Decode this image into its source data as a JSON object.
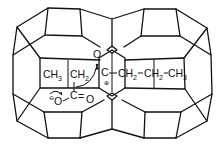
{
  "diagram": {
    "type": "zeolite-cage-transition-state",
    "colors": {
      "line": "#111111",
      "background": "#ffffff"
    },
    "labels": {
      "left_chain": {
        "ch3": "CH",
        "ch3_sub": "3",
        "ch2": "CH",
        "ch2_sub": "2"
      },
      "center_carbon": "C",
      "center_charge": "⊕",
      "right_chain": [
        {
          "text": "CH",
          "sub": "2"
        },
        {
          "text": "CH",
          "sub": "2"
        },
        {
          "text": "CH",
          "sub": "3"
        }
      ],
      "bond": "–",
      "carboxylate": {
        "o_minus": "O",
        "charge": "⊖",
        "c": "C",
        "double_bond": "=",
        "o": "O"
      },
      "framework_oxygen": "O"
    }
  }
}
